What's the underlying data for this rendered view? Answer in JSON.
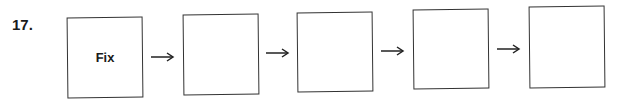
{
  "problem": {
    "number": "17.",
    "boxes": [
      {
        "label": "Fix"
      },
      {
        "label": ""
      },
      {
        "label": ""
      },
      {
        "label": ""
      },
      {
        "label": ""
      }
    ],
    "arrow_glyph": "right-arrow-icon"
  }
}
